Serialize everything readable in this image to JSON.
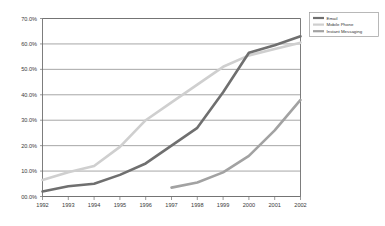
{
  "chart_data": {
    "type": "line",
    "title": "",
    "subtitle": "",
    "xlabel": "",
    "ylabel": "",
    "grid": true,
    "legend_position": "top-right",
    "categories": [
      "1992",
      "1993",
      "1994",
      "1995",
      "1996",
      "1997",
      "1998",
      "1999",
      "2000",
      "2001",
      "2002"
    ],
    "x": [
      1992,
      1993,
      1994,
      1995,
      1996,
      1997,
      1998,
      1999,
      2000,
      2001,
      2002
    ],
    "xlim": [
      1992,
      2002
    ],
    "ylim": [
      0,
      70
    ],
    "ytick_labels": [
      "00.0%",
      "10.0%",
      "20.0%",
      "30.0%",
      "40.0%",
      "50.0%",
      "60.0%",
      "70.0%"
    ],
    "ytick_values": [
      0,
      10,
      20,
      30,
      40,
      50,
      60,
      70
    ],
    "xtick_labels": [
      "1992",
      "1993",
      "1994",
      "1995",
      "1996",
      "1997",
      "1998",
      "1999",
      "2000",
      "2001",
      "2002"
    ],
    "series": [
      {
        "name": "Email",
        "color": "#6f6f6f",
        "values": [
          2.0,
          4.0,
          5.0,
          8.5,
          13.0,
          20.0,
          27.0,
          41.0,
          56.5,
          59.5,
          63.0
        ]
      },
      {
        "name": "Mobile Phone",
        "color": "#cfcfcf",
        "values": [
          6.5,
          9.5,
          12.0,
          19.5,
          30.0,
          37.0,
          44.0,
          51.0,
          55.5,
          58.0,
          60.5
        ]
      },
      {
        "name": "Instant Messaging",
        "color": "#a2a2a2",
        "values": [
          null,
          null,
          null,
          null,
          null,
          3.5,
          5.5,
          9.5,
          16.0,
          26.0,
          38.0
        ]
      }
    ]
  },
  "legend": {
    "entries": [
      {
        "label": "Email",
        "color": "#6f6f6f"
      },
      {
        "label": "Mobile Phone",
        "color": "#cfcfcf"
      },
      {
        "label": "Instant Messaging",
        "color": "#a2a2a2"
      }
    ]
  },
  "colors": {
    "background": "#ffffff",
    "grid": "#808080",
    "axis": "#6e6e6e",
    "text": "#3a3a3a",
    "legend_border": "#9a9a9a"
  }
}
